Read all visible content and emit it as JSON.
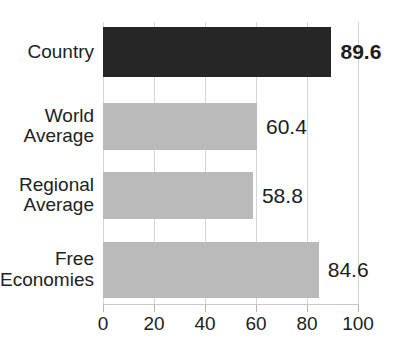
{
  "chart_data": {
    "type": "bar",
    "orientation": "horizontal",
    "title": "",
    "xlabel": "",
    "ylabel": "",
    "categories": [
      "Country",
      "World\nAverage",
      "Regional\nAverage",
      "Free\nEconomies"
    ],
    "values": [
      89.6,
      60.4,
      58.8,
      84.6
    ],
    "value_labels": [
      "89.6",
      "60.4",
      "58.8",
      "84.6"
    ],
    "xlim": [
      0,
      100
    ],
    "xticks": [
      0,
      20,
      40,
      60,
      80,
      100
    ],
    "xtick_labels": [
      "0",
      "20",
      "40",
      "60",
      "80",
      "100"
    ],
    "grid": true,
    "grid_axis": "x",
    "legend": false,
    "highlight_index": 0,
    "colors": {
      "highlight_bar": "#262626",
      "normal_bar": "#b9b9b9",
      "gridline": "#d5d5d5",
      "axis": "#c9c9c9",
      "text": "#1c1c1c",
      "background": "#ffffff"
    },
    "bars": [
      {
        "label": "Country",
        "value": 89.6,
        "value_label": "89.6",
        "style": "highlight",
        "bold_label": true
      },
      {
        "label": "World\nAverage",
        "value": 60.4,
        "value_label": "60.4",
        "style": "normal",
        "bold_label": false
      },
      {
        "label": "Regional\nAverage",
        "value": 58.8,
        "value_label": "58.8",
        "style": "normal",
        "bold_label": false
      },
      {
        "label": "Free\nEconomies",
        "value": 84.6,
        "value_label": "84.6",
        "style": "normal",
        "bold_label": false
      }
    ]
  }
}
